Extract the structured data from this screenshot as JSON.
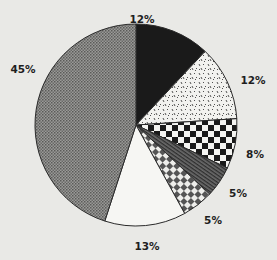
{
  "chart_data": {
    "type": "pie",
    "title": "",
    "start_angle_deg": 0,
    "direction": "clockwise",
    "slices": [
      {
        "label": "12%",
        "value": 12,
        "pattern": "solid-black",
        "label_pos": [
          142,
          23
        ]
      },
      {
        "label": "12%",
        "value": 12,
        "pattern": "speckled-dots",
        "label_pos": [
          253,
          84
        ]
      },
      {
        "label": "8%",
        "value": 8,
        "pattern": "large-checker",
        "label_pos": [
          255,
          158
        ]
      },
      {
        "label": "5%",
        "value": 5,
        "pattern": "diagonal-stripes",
        "label_pos": [
          238,
          197
        ]
      },
      {
        "label": "5%",
        "value": 5,
        "pattern": "small-checker",
        "label_pos": [
          213,
          224
        ]
      },
      {
        "label": "13%",
        "value": 13,
        "pattern": "white",
        "label_pos": [
          147,
          250
        ]
      },
      {
        "label": "45%",
        "value": 45,
        "pattern": "gray-halftone",
        "label_pos": [
          23,
          73
        ]
      }
    ],
    "center": [
      136,
      125
    ],
    "radius": 101,
    "legend": "none"
  },
  "colors": {
    "background": "#e9e9e6",
    "outline": "#2a2a2a",
    "dark": "#1a1a1a",
    "gray": "#8a8a8a"
  }
}
